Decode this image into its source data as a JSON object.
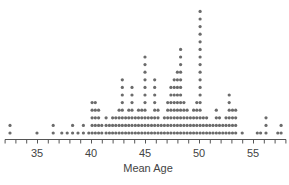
{
  "chart_data": {
    "type": "scatter",
    "subtype": "dot_plot",
    "title": "",
    "xlabel": "Mean Age",
    "ylabel": "",
    "xlim": [
      32,
      58
    ],
    "x_tick_labels": [
      "35",
      "40",
      "45",
      "50",
      "55"
    ],
    "x_ticks": [
      35,
      40,
      45,
      50,
      55
    ],
    "minor_tick_step": 1,
    "grid": false,
    "legend": null,
    "dot_color": "#6b6b6b",
    "stacks": [
      {
        "x": 32.5,
        "count": 2
      },
      {
        "x": 35.0,
        "count": 1
      },
      {
        "x": 36.5,
        "count": 2
      },
      {
        "x": 37.3,
        "count": 1
      },
      {
        "x": 37.8,
        "count": 1
      },
      {
        "x": 38.3,
        "count": 2
      },
      {
        "x": 38.8,
        "count": 1
      },
      {
        "x": 39.3,
        "count": 2
      },
      {
        "x": 39.8,
        "count": 1
      },
      {
        "x": 40.1,
        "count": 5
      },
      {
        "x": 40.4,
        "count": 5
      },
      {
        "x": 40.7,
        "count": 4
      },
      {
        "x": 41.0,
        "count": 2
      },
      {
        "x": 41.4,
        "count": 3
      },
      {
        "x": 41.7,
        "count": 2
      },
      {
        "x": 42.0,
        "count": 3
      },
      {
        "x": 42.3,
        "count": 3
      },
      {
        "x": 42.6,
        "count": 4
      },
      {
        "x": 42.9,
        "count": 8
      },
      {
        "x": 43.2,
        "count": 3
      },
      {
        "x": 43.5,
        "count": 4
      },
      {
        "x": 43.8,
        "count": 7
      },
      {
        "x": 44.1,
        "count": 3
      },
      {
        "x": 44.4,
        "count": 4
      },
      {
        "x": 44.7,
        "count": 4
      },
      {
        "x": 45.0,
        "count": 11
      },
      {
        "x": 45.3,
        "count": 3
      },
      {
        "x": 45.6,
        "count": 3
      },
      {
        "x": 45.9,
        "count": 8
      },
      {
        "x": 46.2,
        "count": 4
      },
      {
        "x": 46.5,
        "count": 2
      },
      {
        "x": 46.8,
        "count": 3
      },
      {
        "x": 47.1,
        "count": 5
      },
      {
        "x": 47.4,
        "count": 7
      },
      {
        "x": 47.7,
        "count": 8
      },
      {
        "x": 48.0,
        "count": 9
      },
      {
        "x": 48.3,
        "count": 12
      },
      {
        "x": 48.6,
        "count": 5
      },
      {
        "x": 48.9,
        "count": 4
      },
      {
        "x": 49.2,
        "count": 3
      },
      {
        "x": 49.5,
        "count": 4
      },
      {
        "x": 49.8,
        "count": 5
      },
      {
        "x": 50.1,
        "count": 17
      },
      {
        "x": 50.4,
        "count": 3
      },
      {
        "x": 50.7,
        "count": 3
      },
      {
        "x": 51.0,
        "count": 2
      },
      {
        "x": 51.3,
        "count": 2
      },
      {
        "x": 51.6,
        "count": 4
      },
      {
        "x": 51.9,
        "count": 3
      },
      {
        "x": 52.2,
        "count": 2
      },
      {
        "x": 52.5,
        "count": 3
      },
      {
        "x": 52.8,
        "count": 6
      },
      {
        "x": 53.1,
        "count": 4
      },
      {
        "x": 53.4,
        "count": 4
      },
      {
        "x": 54.0,
        "count": 1
      },
      {
        "x": 55.4,
        "count": 1
      },
      {
        "x": 55.7,
        "count": 1
      },
      {
        "x": 56.2,
        "count": 3
      },
      {
        "x": 57.3,
        "count": 1
      },
      {
        "x": 57.6,
        "count": 2
      }
    ]
  }
}
